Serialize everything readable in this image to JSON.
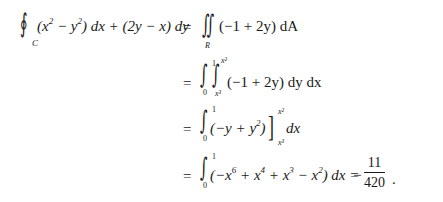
{
  "equation": {
    "line1": {
      "lhs_integral_symbol": "∮",
      "lhs_subscript": "C",
      "lhs_integrand_parts": [
        "(x",
        "2",
        " − y",
        "2",
        ") dx + (2y − x) dy"
      ],
      "equals": "=",
      "rhs_integral_symbol": "∬",
      "rhs_subscript": "R",
      "rhs_integrand": "(−1 + 2y) dA"
    },
    "line2": {
      "equals": "=",
      "outer_lower": "0",
      "outer_upper": "1",
      "inner_lower": "x³",
      "inner_upper": "x²",
      "integrand": "(−1 + 2y) dy dx"
    },
    "line3": {
      "equals": "=",
      "lower": "0",
      "upper": "1",
      "expression_parts": [
        "(−y + y",
        "2",
        ")"
      ],
      "eval_upper": "x²",
      "eval_lower": "x³",
      "differential": "dx"
    },
    "line4": {
      "equals": "=",
      "lower": "0",
      "upper": "1",
      "integrand_parts": [
        "(−x",
        "6",
        " + x",
        "4",
        " + x",
        "3",
        " − x",
        "2",
        ") dx ="
      ],
      "result_sign": "−",
      "result_numerator": "11",
      "result_denominator": "420",
      "trailing_punct": "."
    }
  }
}
